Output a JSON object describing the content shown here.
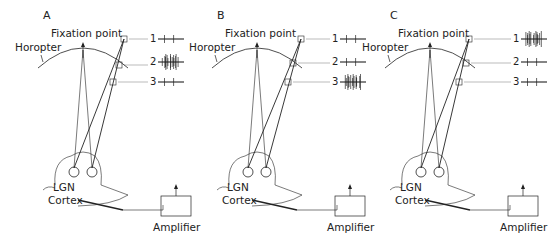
{
  "figure": {
    "panels": [
      {
        "id": "A",
        "label": "A",
        "fixation_label": "Fixation point",
        "horopter_label": "Horopter",
        "lgn_label": "LGN",
        "cortex_label": "Cortex",
        "amplifier_label": "Amplifier",
        "traces": [
          {
            "num": "1",
            "activity": "low"
          },
          {
            "num": "2",
            "activity": "high"
          },
          {
            "num": "3",
            "activity": "low"
          }
        ]
      },
      {
        "id": "B",
        "label": "B",
        "fixation_label": "Fixation point",
        "horopter_label": "Horopter",
        "lgn_label": "LGN",
        "cortex_label": "Cortex",
        "amplifier_label": "Amplifier",
        "traces": [
          {
            "num": "1",
            "activity": "low"
          },
          {
            "num": "2",
            "activity": "low"
          },
          {
            "num": "3",
            "activity": "high"
          }
        ]
      },
      {
        "id": "C",
        "label": "C",
        "fixation_label": "Fixation point",
        "horopter_label": "Horopter",
        "lgn_label": "LGN",
        "cortex_label": "Cortex",
        "amplifier_label": "Amplifier",
        "traces": [
          {
            "num": "1",
            "activity": "high"
          },
          {
            "num": "2",
            "activity": "low"
          },
          {
            "num": "3",
            "activity": "low"
          }
        ]
      }
    ],
    "colors": {
      "ink": "#222222",
      "background": "#ffffff"
    }
  }
}
